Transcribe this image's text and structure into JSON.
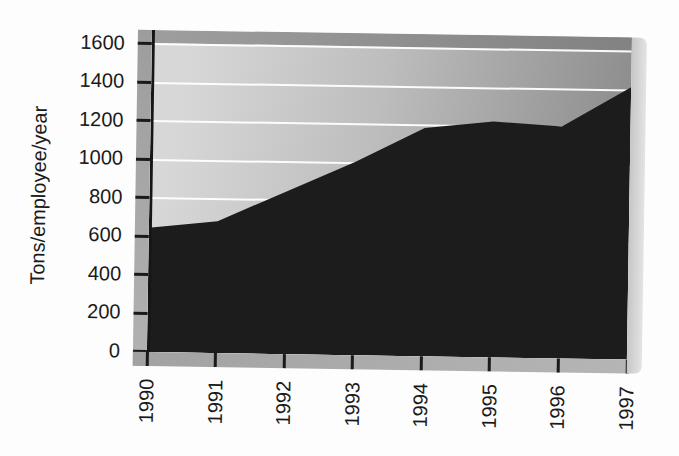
{
  "chart_data": {
    "type": "area",
    "title": "",
    "ylabel": "Tons/employee/year",
    "xlabel": "",
    "categories": [
      "1990",
      "1991",
      "1992",
      "1993",
      "1994",
      "1995",
      "1996",
      "1997"
    ],
    "values": [
      640,
      680,
      840,
      1000,
      1180,
      1220,
      1200,
      1410
    ],
    "ylim": [
      0,
      1600
    ],
    "ytick_step": 200,
    "ytick_labels": [
      "1600",
      "1400",
      "1200",
      "1000",
      "800",
      "600",
      "400",
      "200",
      "0"
    ],
    "grid": "horizontal-white-gridlines",
    "legend_position": "none",
    "colors": {
      "area": "#1c1c1c",
      "plot_background_light": "#d7d7d7",
      "plot_background_dark": "#8a8a8a",
      "gridline": "#ffffff",
      "axis_band": "#a8a8a8",
      "text": "#1a1a1a"
    }
  }
}
